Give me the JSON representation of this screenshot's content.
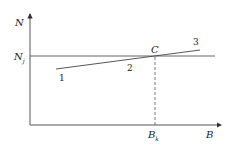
{
  "diagram": {
    "y_axis_label": "N",
    "x_axis_label": "B",
    "level_label_main": "N",
    "level_label_sub": "j",
    "point_label": "C",
    "point_x_label_main": "B",
    "point_x_label_sub": "k",
    "line_labels": [
      "1",
      "2",
      "3"
    ],
    "colors": {
      "line": "#333333",
      "axis": "#444444",
      "background": "#ffffff"
    }
  }
}
